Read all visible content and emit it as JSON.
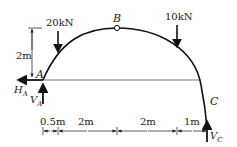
{
  "diagram": {
    "type": "three-hinged arch",
    "points": {
      "A": "A",
      "B": "B",
      "C": "C"
    },
    "loads": [
      {
        "label": "20kN",
        "position": "left",
        "direction": "down"
      },
      {
        "label": "10kN",
        "position": "right",
        "direction": "down"
      }
    ],
    "reactions": {
      "HA_main": "H",
      "HA_sub": "A",
      "VA_main": "V",
      "VA_sub": "A",
      "VC_main": "V",
      "VC_sub": "C"
    },
    "height_dimension": "2m",
    "span_dimensions": [
      "0.5m",
      "2m",
      "2m",
      "1m"
    ]
  }
}
